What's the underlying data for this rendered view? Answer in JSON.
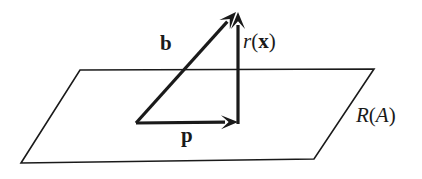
{
  "figure": {
    "background_color": "#ffffff",
    "ink_color": "#1a1a1a",
    "width": 422,
    "height": 179
  },
  "labels": {
    "vector_b": "b",
    "vector_p": "p",
    "residual_r_head": "r",
    "residual_r_open": "(",
    "residual_r_arg": "x",
    "residual_r_close": ")",
    "residual_full": "r(x)",
    "subspace_head": "R",
    "subspace_open": "(",
    "subspace_arg": "A",
    "subspace_close": ")",
    "subspace_full": "R(A)"
  },
  "geometry": {
    "plane": {
      "name": "range-plane",
      "stroke_width": 1.6,
      "points": [
        {
          "x": 80,
          "y": 70
        },
        {
          "x": 374,
          "y": 69
        },
        {
          "x": 314,
          "y": 159
        },
        {
          "x": 21,
          "y": 163
        }
      ]
    },
    "vectors": [
      {
        "name": "vector-b",
        "label": "b",
        "stroke_width": 3.2,
        "tail": {
          "x": 136,
          "y": 123
        },
        "tip": {
          "x": 236,
          "y": 12
        }
      },
      {
        "name": "vector-p",
        "label": "p",
        "stroke_width": 3.2,
        "tail": {
          "x": 136,
          "y": 123
        },
        "tip": {
          "x": 238,
          "y": 122
        }
      },
      {
        "name": "vector-r",
        "label": "r(x)",
        "stroke_width": 3.2,
        "tail": {
          "x": 238,
          "y": 124
        },
        "tip": {
          "x": 238,
          "y": 12
        }
      }
    ],
    "arrowhead": {
      "length": 17,
      "half_width": 7
    }
  },
  "chart_data": {
    "type": "diagram",
    "elements": [
      {
        "kind": "plane",
        "label": "R(A)",
        "role": "column-space-of-A"
      },
      {
        "kind": "vector",
        "label": "b",
        "role": "data-vector",
        "from": "origin",
        "to": "apex"
      },
      {
        "kind": "vector",
        "label": "p",
        "role": "projection-in-plane",
        "from": "origin",
        "to": "foot"
      },
      {
        "kind": "vector",
        "label": "r(x)",
        "role": "residual-orthogonal",
        "from": "foot",
        "to": "apex"
      }
    ],
    "relations": [
      "b = p + r(x)",
      "p lies in R(A)",
      "r(x) is orthogonal to R(A)"
    ]
  }
}
